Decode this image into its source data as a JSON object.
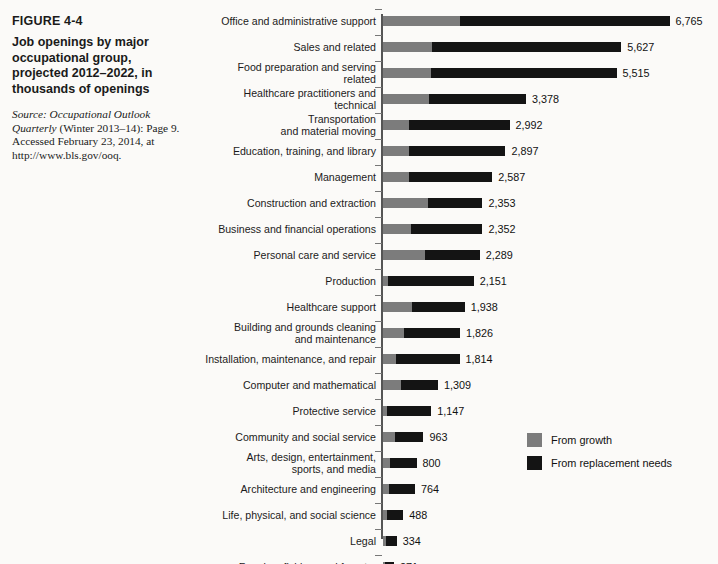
{
  "caption": {
    "figure_number": "FIGURE 4-4",
    "title": "Job openings by major occupational group, projected 2012–2022, in thousands of openings",
    "source_prefix": "Source:",
    "source_italic": "Occupational Outlook Quarterly",
    "source_rest": "(Winter 2013–14): Page 9. Accessed February 23, 2014, at http://www.bls.gov/ooq."
  },
  "legend": {
    "position": "center-right",
    "items": [
      {
        "label": "From growth",
        "color": "#7c7c7c",
        "key": "growth"
      },
      {
        "label": "From replacement needs",
        "color": "#141414",
        "key": "replacement"
      }
    ]
  },
  "colors": {
    "growth": "#7c7c7c",
    "replacement": "#141414",
    "axis": "#555555",
    "background": "#fbfaf8",
    "text": "#1a1a1a"
  },
  "chart_data": {
    "type": "bar",
    "orientation": "horizontal",
    "stacked": true,
    "title": "Job openings by major occupational group, projected 2012–2022, in thousands of openings",
    "xlabel": "",
    "ylabel": "",
    "units": "thousands of openings",
    "grid": false,
    "legend_position": "center-right",
    "xlim": [
      0,
      6765
    ],
    "categories": [
      "Office and administrative support",
      "Sales and related",
      "Food preparation and serving related",
      "Healthcare practitioners and technical",
      "Transportation and material moving",
      "Education, training, and library",
      "Management",
      "Construction and extraction",
      "Business and financial operations",
      "Personal care and service",
      "Production",
      "Healthcare support",
      "Building and grounds cleaning and maintenance",
      "Installation, maintenance, and repair",
      "Computer and mathematical",
      "Protective service",
      "Community and social service",
      "Arts, design, entertainment, sports, and media",
      "Architecture and engineering",
      "Life, physical, and social science",
      "Legal",
      "Farming, fishing, and forestry"
    ],
    "series": [
      {
        "name": "From growth",
        "color": "#7c7c7c",
        "values": [
          1825,
          1158,
          1130,
          1100,
          626,
          618,
          615,
          1065,
          681,
          1000,
          135,
          685,
          500,
          324,
          425,
          110,
          300,
          163,
          156,
          100,
          73,
          53
        ]
      },
      {
        "name": "From replacement needs",
        "color": "#141414",
        "values": [
          4940,
          4469,
          4385,
          2278,
          2366,
          2279,
          1972,
          1288,
          1671,
          1289,
          2016,
          1253,
          1326,
          1490,
          884,
          1037,
          663,
          637,
          608,
          388,
          261,
          218
        ]
      }
    ],
    "totals": [
      6765,
      5627,
      5515,
      3378,
      2992,
      2897,
      2587,
      2353,
      2352,
      2289,
      2151,
      1938,
      1826,
      1814,
      1309,
      1147,
      963,
      800,
      764,
      488,
      334,
      271
    ],
    "total_labels": [
      "6,765",
      "5,627",
      "5,515",
      "3,378",
      "2,992",
      "2,897",
      "2,587",
      "2,353",
      "2,352",
      "2,289",
      "2,151",
      "1,938",
      "1,826",
      "1,814",
      "1,309",
      "1,147",
      "963",
      "800",
      "764",
      "488",
      "334",
      "271"
    ]
  },
  "rows": [
    {
      "label_lines": [
        "Office and administrative support"
      ],
      "growth": 1825,
      "replacement": 4940,
      "total": 6765,
      "total_label": "6,765"
    },
    {
      "label_lines": [
        "Sales and related"
      ],
      "growth": 1158,
      "replacement": 4469,
      "total": 5627,
      "total_label": "5,627"
    },
    {
      "label_lines": [
        "Food preparation and serving",
        "related"
      ],
      "growth": 1130,
      "replacement": 4385,
      "total": 5515,
      "total_label": "5,515"
    },
    {
      "label_lines": [
        "Healthcare practitioners and",
        "technical"
      ],
      "growth": 1100,
      "replacement": 2278,
      "total": 3378,
      "total_label": "3,378"
    },
    {
      "label_lines": [
        "Transportation",
        "and material moving"
      ],
      "growth": 626,
      "replacement": 2366,
      "total": 2992,
      "total_label": "2,992"
    },
    {
      "label_lines": [
        "Education, training, and library"
      ],
      "growth": 618,
      "replacement": 2279,
      "total": 2897,
      "total_label": "2,897"
    },
    {
      "label_lines": [
        "Management"
      ],
      "growth": 615,
      "replacement": 1972,
      "total": 2587,
      "total_label": "2,587"
    },
    {
      "label_lines": [
        "Construction and extraction"
      ],
      "growth": 1065,
      "replacement": 1288,
      "total": 2353,
      "total_label": "2,353"
    },
    {
      "label_lines": [
        "Business and financial operations"
      ],
      "growth": 681,
      "replacement": 1671,
      "total": 2352,
      "total_label": "2,352"
    },
    {
      "label_lines": [
        "Personal care and service"
      ],
      "growth": 1000,
      "replacement": 1289,
      "total": 2289,
      "total_label": "2,289"
    },
    {
      "label_lines": [
        "Production"
      ],
      "growth": 135,
      "replacement": 2016,
      "total": 2151,
      "total_label": "2,151"
    },
    {
      "label_lines": [
        "Healthcare support"
      ],
      "growth": 685,
      "replacement": 1253,
      "total": 1938,
      "total_label": "1,938"
    },
    {
      "label_lines": [
        "Building and grounds cleaning",
        "and maintenance"
      ],
      "growth": 500,
      "replacement": 1326,
      "total": 1826,
      "total_label": "1,826"
    },
    {
      "label_lines": [
        "Installation, maintenance, and repair"
      ],
      "growth": 324,
      "replacement": 1490,
      "total": 1814,
      "total_label": "1,814"
    },
    {
      "label_lines": [
        "Computer and mathematical"
      ],
      "growth": 425,
      "replacement": 884,
      "total": 1309,
      "total_label": "1,309"
    },
    {
      "label_lines": [
        "Protective service"
      ],
      "growth": 110,
      "replacement": 1037,
      "total": 1147,
      "total_label": "1,147"
    },
    {
      "label_lines": [
        "Community and social service"
      ],
      "growth": 300,
      "replacement": 663,
      "total": 963,
      "total_label": "963"
    },
    {
      "label_lines": [
        "Arts, design, entertainment,",
        "sports, and media"
      ],
      "growth": 163,
      "replacement": 637,
      "total": 800,
      "total_label": "800"
    },
    {
      "label_lines": [
        "Architecture and engineering"
      ],
      "growth": 156,
      "replacement": 608,
      "total": 764,
      "total_label": "764"
    },
    {
      "label_lines": [
        "Life, physical, and social science"
      ],
      "growth": 100,
      "replacement": 388,
      "total": 488,
      "total_label": "488"
    },
    {
      "label_lines": [
        "Legal"
      ],
      "growth": 73,
      "replacement": 261,
      "total": 334,
      "total_label": "334"
    },
    {
      "label_lines": [
        "Farming, fishing, and forestry"
      ],
      "growth": 53,
      "replacement": 218,
      "total": 271,
      "total_label": "271"
    }
  ]
}
